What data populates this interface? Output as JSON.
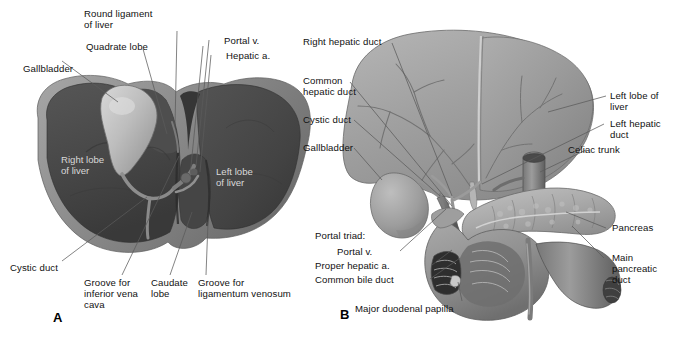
{
  "figure": {
    "background_color": "#ffffff",
    "width": 691,
    "height": 343,
    "label_color": "#111111",
    "overlay_label_color": "#d8d8d8"
  },
  "panels": [
    {
      "letter": "A",
      "name": "visceral-surface-of-liver",
      "external_labels": [
        {
          "text": "Round ligament\nof liver"
        },
        {
          "text": "Quadrate lobe"
        },
        {
          "text": "Gallbladder"
        },
        {
          "text": "Portal v."
        },
        {
          "text": "Hepatic a."
        },
        {
          "text": "Cystic duct"
        },
        {
          "text": "Groove for\ninferior vena\ncava"
        },
        {
          "text": "Caudate\nlobe"
        },
        {
          "text": "Groove for\nligamentum venosum"
        }
      ],
      "overlay_labels": [
        {
          "text": "Right lobe\nof liver"
        },
        {
          "text": "Left lobe\nof liver"
        }
      ]
    },
    {
      "letter": "B",
      "name": "liver-pancreas-duodenum-biliary-tree",
      "external_labels": [
        {
          "text": "Right hepatic duct"
        },
        {
          "text": "Common\nhepatic duct"
        },
        {
          "text": "Cystic duct"
        },
        {
          "text": "Gallbladder"
        },
        {
          "text": "Left lobe of\nliver"
        },
        {
          "text": "Left hepatic\nduct"
        },
        {
          "text": "Celiac trunk"
        },
        {
          "text": "Pancreas"
        },
        {
          "text": "Main\npancreatic\nduct"
        },
        {
          "text": "Portal triad:"
        },
        {
          "text": "Portal v."
        },
        {
          "text": "Proper hepatic a."
        },
        {
          "text": "Common bile duct"
        },
        {
          "text": "Major duodenal papilla"
        }
      ],
      "overlay_labels": []
    }
  ],
  "labels": {
    "a_round_ligament": "Round ligament\nof liver",
    "a_quadrate_lobe": "Quadrate lobe",
    "a_gallbladder": "Gallbladder",
    "a_portal_v": "Portal v.",
    "a_hepatic_a": "Hepatic a.",
    "a_right_lobe": "Right lobe\nof liver",
    "a_left_lobe": "Left lobe\nof liver",
    "a_cystic_duct": "Cystic duct",
    "a_groove_ivc": "Groove for\ninferior vena\ncava",
    "a_caudate_lobe": "Caudate\nlobe",
    "a_groove_lig_venosum": "Groove for\nligamentum venosum",
    "a_letter": "A",
    "b_right_hepatic_duct": "Right hepatic duct",
    "b_common_hepatic_duct": "Common\nhepatic duct",
    "b_cystic_duct": "Cystic duct",
    "b_gallbladder": "Gallbladder",
    "b_left_lobe": "Left lobe of\nliver",
    "b_left_hepatic_duct": "Left hepatic\nduct",
    "b_celiac_trunk": "Celiac trunk",
    "b_pancreas": "Pancreas",
    "b_main_pancreatic_duct": "Main\npancreatic\nduct",
    "b_portal_triad": "Portal triad:",
    "b_portal_v": "Portal v.",
    "b_proper_hepatic_a": "Proper hepatic a.",
    "b_common_bile_duct": "Common bile duct",
    "b_major_duodenal_papilla": "Major duodenal papilla",
    "b_letter": "B"
  },
  "colors": {
    "liver_dark": "#4a4a4a",
    "liver_dark_shade": "#3c3c3c",
    "liver_rim": "#8e8e8e",
    "gallbladder_light": "#b8b8b8",
    "liver_light": "#9a9a9a",
    "liver_light_shade": "#8a8a8a",
    "vessel_gray": "#6e6e6e",
    "pancreas_gray": "#a8a8a8",
    "duodenum_gray": "#8d8d8d",
    "leader_line": "#555555",
    "leader_line_light": "#cfcfcf"
  }
}
